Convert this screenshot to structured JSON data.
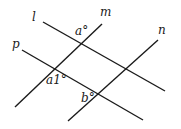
{
  "diagram": {
    "lines": [
      {
        "name": "l",
        "x1": 43,
        "y1": 22,
        "x2": 165,
        "y2": 91
      },
      {
        "name": "p",
        "x1": 22,
        "y1": 50,
        "x2": 143,
        "y2": 120
      },
      {
        "name": "m",
        "x1": 15,
        "y1": 107,
        "x2": 102,
        "y2": 24
      },
      {
        "name": "n",
        "x1": 68,
        "y1": 121,
        "x2": 158,
        "y2": 40
      }
    ],
    "line_labels": {
      "l": "l",
      "m": "m",
      "n": "n",
      "p": "p"
    },
    "angle_labels": {
      "a": "a°",
      "a1": "a1°",
      "b": "b°"
    },
    "colors": {
      "stroke": "#1a1a1a",
      "background": "#ffffff"
    }
  }
}
